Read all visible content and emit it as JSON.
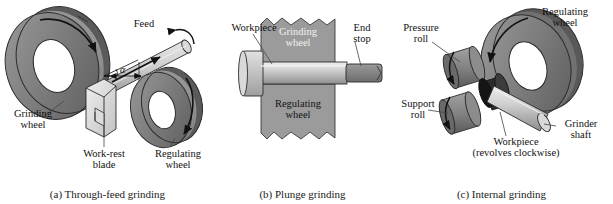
{
  "figure": {
    "background": "#ffffff",
    "ink": "#111111",
    "wheel_gray": "#8a8a8a",
    "wheel_dark": "#5e5e5e",
    "wheel_light": "#b9b9b9",
    "workpiece_gray": "#cfcfcf"
  },
  "panels": [
    {
      "id": "a",
      "caption": "(a) Through-feed grinding",
      "labels": {
        "grinding_wheel": "Grinding\nwheel",
        "grinding_wheel_line1": "Grinding",
        "grinding_wheel_line2": "wheel",
        "feed": "Feed",
        "angle_symbol": "α",
        "work_rest_blade_line1": "Work-rest",
        "work_rest_blade_line2": "blade",
        "regulating_wheel_line1": "Regulating",
        "regulating_wheel_line2": "wheel"
      }
    },
    {
      "id": "b",
      "caption": "(b) Plunge grinding",
      "labels": {
        "workpiece": "Workpiece",
        "grinding_wheel_line1": "Grinding",
        "grinding_wheel_line2": "wheel",
        "end_stop_line1": "End",
        "end_stop_line2": "stop",
        "regulating_wheel_line1": "Regulating",
        "regulating_wheel_line2": "wheel"
      }
    },
    {
      "id": "c",
      "caption": "(c) Internal grinding",
      "labels": {
        "pressure_roll_line1": "Pressure",
        "pressure_roll_line2": "roll",
        "support_roll_line1": "Support",
        "support_roll_line2": "roll",
        "regulating_wheel_line1": "Regulating",
        "regulating_wheel_line2": "wheel",
        "grinder_shaft_line1": "Grinder",
        "grinder_shaft_line2": "shaft",
        "workpiece_line1": "Workpiece",
        "workpiece_line2": "(revolves clockwise)"
      }
    }
  ]
}
